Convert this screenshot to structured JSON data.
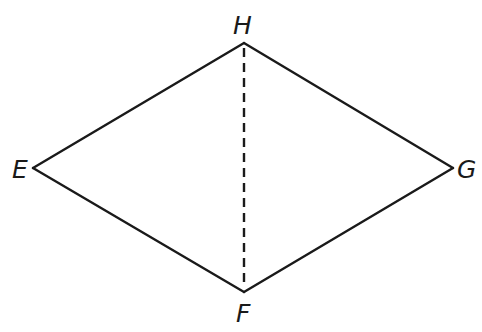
{
  "diagram": {
    "type": "geometry",
    "shape": "rhombus",
    "stroke_color": "#1a1a1a",
    "background": "#ffffff",
    "vertices": {
      "H": {
        "label": "H",
        "x": 244,
        "y": 43
      },
      "E": {
        "label": "E",
        "x": 33,
        "y": 168
      },
      "F": {
        "label": "F",
        "x": 244,
        "y": 292
      },
      "G": {
        "label": "G",
        "x": 453,
        "y": 168
      }
    },
    "edges": [
      {
        "from": "H",
        "to": "G",
        "style": "solid"
      },
      {
        "from": "G",
        "to": "F",
        "style": "solid"
      },
      {
        "from": "F",
        "to": "E",
        "style": "solid"
      },
      {
        "from": "E",
        "to": "H",
        "style": "solid"
      },
      {
        "from": "H",
        "to": "F",
        "style": "dashed"
      }
    ]
  }
}
